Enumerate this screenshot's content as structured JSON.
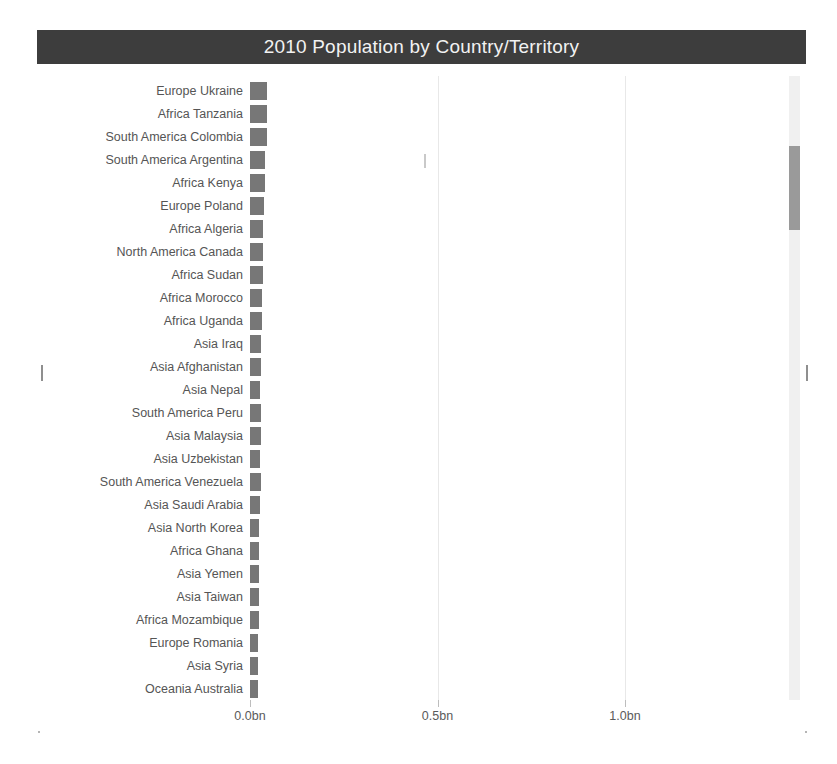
{
  "chart": {
    "title": "2010 Population by Country/Territory"
  },
  "axis": {
    "ticks": [
      {
        "label": "0.0bn",
        "value": 0.0
      },
      {
        "label": "0.5bn",
        "value": 0.5
      },
      {
        "label": "1.0bn",
        "value": 1.0
      }
    ]
  },
  "scrollbar": {
    "name": "vertical-scrollbar"
  },
  "chart_data": {
    "type": "bar",
    "orientation": "horizontal",
    "title": "2010 Population by Country/Territory",
    "xlabel": "",
    "ylabel": "",
    "xlim": [
      0,
      1.15
    ],
    "unit": "bn",
    "grid": true,
    "legend": false,
    "xtick_labels": [
      "0.0bn",
      "0.5bn",
      "1.0bn"
    ],
    "xtick_values": [
      0.0,
      0.5,
      1.0
    ],
    "categories": [
      "Europe Ukraine",
      "Africa Tanzania",
      "South America Colombia",
      "South America Argentina",
      "Africa Kenya",
      "Europe Poland",
      "Africa Algeria",
      "North America Canada",
      "Africa Sudan",
      "Africa Morocco",
      "Africa Uganda",
      "Asia Iraq",
      "Asia Afghanistan",
      "Asia Nepal",
      "South America Peru",
      "Asia Malaysia",
      "Asia Uzbekistan",
      "South America Venezuela",
      "Asia Saudi Arabia",
      "Asia North Korea",
      "Africa Ghana",
      "Asia Yemen",
      "Asia Taiwan",
      "Africa Mozambique",
      "Europe Romania",
      "Asia Syria",
      "Oceania Australia"
    ],
    "values": [
      0.0459,
      0.0449,
      0.0445,
      0.041,
      0.0405,
      0.038,
      0.0358,
      0.0341,
      0.034,
      0.032,
      0.0318,
      0.03,
      0.0288,
      0.027,
      0.0294,
      0.0282,
      0.0276,
      0.0284,
      0.0272,
      0.0245,
      0.0247,
      0.0238,
      0.0232,
      0.0235,
      0.0202,
      0.0209,
      0.022
    ]
  }
}
